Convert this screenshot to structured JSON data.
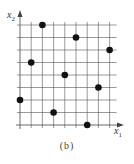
{
  "figure": {
    "caption": "(b)",
    "x_axis_label": "x",
    "x_axis_sub": "1",
    "y_axis_label": "x",
    "y_axis_sub": "2",
    "grid_color": "#555555",
    "point_color": "#111111"
  },
  "chart_data": {
    "type": "scatter",
    "title": "(b)",
    "xlabel": "x1",
    "ylabel": "x2",
    "grid": true,
    "xlim": [
      0,
      8
    ],
    "ylim": [
      0,
      8
    ],
    "grid_cells": 8,
    "points": [
      {
        "x": 0,
        "y": 2
      },
      {
        "x": 1,
        "y": 5
      },
      {
        "x": 2,
        "y": 8
      },
      {
        "x": 3,
        "y": 1
      },
      {
        "x": 4,
        "y": 4
      },
      {
        "x": 5,
        "y": 7
      },
      {
        "x": 6,
        "y": 0
      },
      {
        "x": 7,
        "y": 3
      },
      {
        "x": 8,
        "y": 6
      }
    ]
  }
}
